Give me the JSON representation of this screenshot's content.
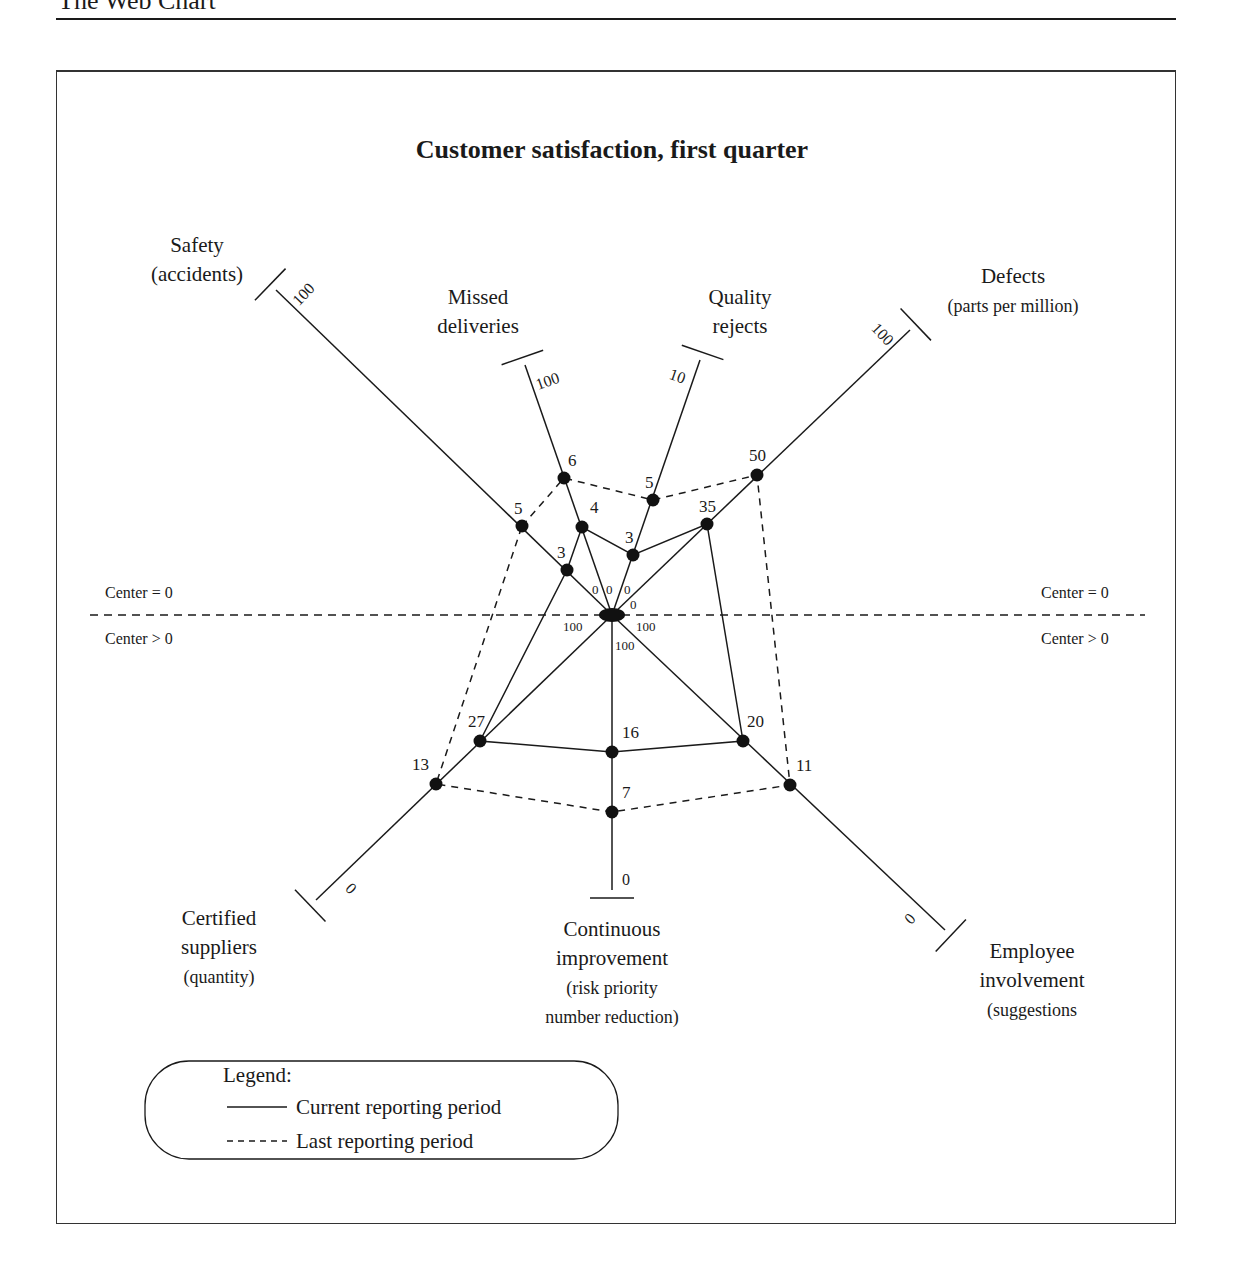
{
  "page": {
    "header_title": "The Web Chart"
  },
  "chart_data": {
    "type": "radar",
    "title": "Customer satisfaction, first quarter",
    "center": {
      "x": 612,
      "y": 615
    },
    "divider": {
      "y": 615,
      "upper_label": "Center = 0",
      "lower_label": "Center > 0"
    },
    "axes": [
      {
        "id": "safety",
        "label_lines": [
          "Safety",
          "(accidents)"
        ],
        "end": {
          "x": 276,
          "y": 290
        },
        "outer_value": "100",
        "center_value": "0",
        "current": 3,
        "last": 5,
        "current_pt": {
          "x": 567,
          "y": 570
        },
        "last_pt": {
          "x": 522,
          "y": 526
        }
      },
      {
        "id": "missed-deliveries",
        "label_lines": [
          "Missed",
          "deliveries"
        ],
        "end": {
          "x": 525,
          "y": 365
        },
        "outer_value": "100",
        "center_value": "0",
        "current": 4,
        "last": 6,
        "current_pt": {
          "x": 582,
          "y": 527
        },
        "last_pt": {
          "x": 564,
          "y": 478
        }
      },
      {
        "id": "quality-rejects",
        "label_lines": [
          "Quality",
          "rejects"
        ],
        "end": {
          "x": 700,
          "y": 360
        },
        "outer_value": "10",
        "center_value": "0",
        "current": 3,
        "last": 5,
        "current_pt": {
          "x": 633,
          "y": 555
        },
        "last_pt": {
          "x": 653,
          "y": 500
        }
      },
      {
        "id": "defects",
        "label_lines": [
          "Defects",
          "(parts per million)"
        ],
        "end": {
          "x": 910,
          "y": 330
        },
        "outer_value": "100",
        "center_value": "0",
        "current": 35,
        "last": 50,
        "current_pt": {
          "x": 707,
          "y": 524
        },
        "last_pt": {
          "x": 757,
          "y": 475
        }
      },
      {
        "id": "employee-involvement",
        "label_lines": [
          "Employee",
          "involvement",
          "(suggestions"
        ],
        "end": {
          "x": 945,
          "y": 930
        },
        "outer_value": "0",
        "center_value": "100",
        "current": 20,
        "last": 11,
        "current_pt": {
          "x": 743,
          "y": 741
        },
        "last_pt": {
          "x": 790,
          "y": 785
        }
      },
      {
        "id": "continuous-improvement",
        "label_lines": [
          "Continuous",
          "improvement",
          "(risk priority",
          "number reduction)"
        ],
        "end": {
          "x": 612,
          "y": 890
        },
        "outer_value": "0",
        "center_value": "100",
        "current": 16,
        "last": 7,
        "current_pt": {
          "x": 612,
          "y": 752
        },
        "last_pt": {
          "x": 612,
          "y": 812
        }
      },
      {
        "id": "certified-suppliers",
        "label_lines": [
          "Certified",
          "suppliers",
          "(quantity)"
        ],
        "end": {
          "x": 316,
          "y": 900
        },
        "outer_value": "0",
        "center_value": "100",
        "current": 27,
        "last": 13,
        "current_pt": {
          "x": 480,
          "y": 741
        },
        "last_pt": {
          "x": 436,
          "y": 784
        }
      }
    ],
    "series": [
      {
        "name": "Current reporting period",
        "style": "solid",
        "values": {
          "Safety": 3,
          "Missed deliveries": 4,
          "Quality rejects": 3,
          "Defects": 35,
          "Employee involvement": 20,
          "Continuous improvement": 16,
          "Certified suppliers": 27
        }
      },
      {
        "name": "Last reporting period",
        "style": "dashed",
        "values": {
          "Safety": 5,
          "Missed deliveries": 6,
          "Quality rejects": 5,
          "Defects": 50,
          "Employee involvement": 11,
          "Continuous improvement": 7,
          "Certified suppliers": 13
        }
      }
    ],
    "legend": {
      "title": "Legend:",
      "items": [
        {
          "symbol": "———",
          "label": "Current reporting period"
        },
        {
          "symbol": "-----",
          "label": "Last reporting period"
        }
      ]
    },
    "colors": {
      "ink": "#1a1a1a",
      "frame": "#333333",
      "background": "#ffffff"
    }
  }
}
